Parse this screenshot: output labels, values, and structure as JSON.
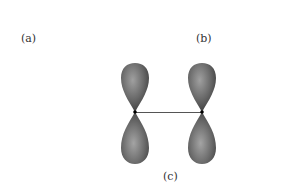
{
  "labels": {
    "a": "(a)",
    "b": "(b)",
    "c": "(c)"
  },
  "diagram": {
    "lobe_color": "#6e6e6e",
    "lobe_highlight": "#a8a8a8",
    "lobe_shadow": "#3c3c3c",
    "bond_color": "#555555",
    "nucleus_color": "#000000"
  }
}
